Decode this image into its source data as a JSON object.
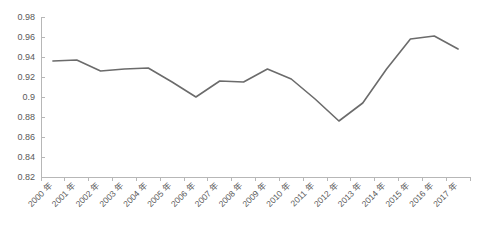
{
  "chart_data": {
    "type": "line",
    "title": "",
    "subtitle": "",
    "xlabel": "",
    "ylabel": "",
    "grid": false,
    "legend": false,
    "legend_position": "none",
    "line_color": "#6b6b6b",
    "axis_color": "#b7b7b7",
    "tick_label_color": "#595959",
    "background_color": "#ffffff",
    "xlim_categories": 18,
    "ylim": [
      0.82,
      0.98
    ],
    "ytick_step": 0.02,
    "yticks": [
      "0.98",
      "0.96",
      "0.94",
      "0.92",
      "0.9",
      "0.88",
      "0.86",
      "0.84",
      "0.82"
    ],
    "ytick_values": [
      0.98,
      0.96,
      0.94,
      0.92,
      0.9,
      0.88,
      0.86,
      0.84,
      0.82
    ],
    "categories": [
      "2000 年",
      "2001 年",
      "2002 年",
      "2003 年",
      "2004 年",
      "2005 年",
      "2006 年",
      "2007 年",
      "2008 年",
      "2009 年",
      "2010 年",
      "2011 年",
      "2012 年",
      "2013 年",
      "2014 年",
      "2015 年",
      "2016 年",
      "2017 年"
    ],
    "series": [
      {
        "name": "series-1",
        "values": [
          0.936,
          0.937,
          0.926,
          0.928,
          0.929,
          0.915,
          0.9,
          0.916,
          0.915,
          0.928,
          0.918,
          0.898,
          0.876,
          0.894,
          0.928,
          0.958,
          0.961,
          0.948
        ]
      }
    ],
    "annotations": []
  }
}
